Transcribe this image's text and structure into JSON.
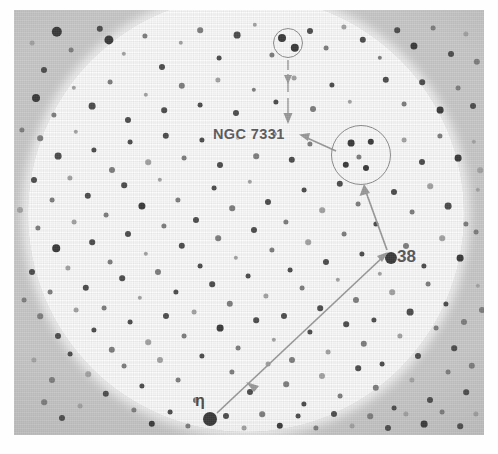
{
  "figure": {
    "kind": "astronomical-finder-chart",
    "plate_background_color": "#c9c9c9",
    "field_color": "#fcfcfc",
    "ink_color": "#4c4c4c",
    "annotation_color": "#9a9a9a"
  },
  "labels": {
    "ngc": "NGC 7331",
    "star_38": "38",
    "star_eta": "η"
  },
  "markers": {
    "small_circle": {
      "cx": 274,
      "cy": 33,
      "r": 15,
      "contains_stars": 2
    },
    "large_circle": {
      "cx": 347,
      "cy": 145,
      "r": 30,
      "contains_stars": 5
    },
    "star_38_point": {
      "x": 377,
      "y": 248
    },
    "star_eta_point": {
      "x": 196,
      "y": 409
    }
  },
  "arrows": [
    {
      "name": "small-circle-to-ngc",
      "from": [
        274,
        50
      ],
      "to": [
        274,
        112
      ],
      "heads": "end",
      "style": "dashed-vertical"
    },
    {
      "name": "large-circle-to-ngc-label",
      "from": [
        320,
        140
      ],
      "to": [
        286,
        126
      ],
      "heads": "end",
      "style": "solid"
    },
    {
      "name": "star38-to-large-circle",
      "from": [
        374,
        240
      ],
      "to": [
        350,
        177
      ],
      "heads": "end",
      "style": "solid"
    },
    {
      "name": "eta-to-star38",
      "from": [
        202,
        404
      ],
      "to": [
        371,
        245
      ],
      "heads": "both-plus-midpoint",
      "style": "solid"
    }
  ],
  "stars": [
    [
      43,
      22,
      5.2,
      "dark"
    ],
    [
      57,
      40,
      2.4,
      "soft"
    ],
    [
      86,
      19,
      3.2,
      ""
    ],
    [
      95,
      30,
      4.6,
      "dark"
    ],
    [
      110,
      44,
      2.2,
      "faint"
    ],
    [
      131,
      26,
      2.6,
      "soft"
    ],
    [
      148,
      57,
      3.0,
      ""
    ],
    [
      167,
      33,
      2.2,
      "faint"
    ],
    [
      186,
      20,
      2.8,
      "soft"
    ],
    [
      205,
      48,
      2.4,
      ""
    ],
    [
      223,
      25,
      3.4,
      ""
    ],
    [
      241,
      15,
      2.2,
      "faint"
    ],
    [
      258,
      45,
      2.6,
      "soft"
    ],
    [
      296,
      21,
      3.0,
      ""
    ],
    [
      312,
      38,
      2.4,
      "soft"
    ],
    [
      330,
      17,
      2.6,
      "faint"
    ],
    [
      349,
      30,
      3.2,
      ""
    ],
    [
      366,
      48,
      2.2,
      "soft"
    ],
    [
      383,
      20,
      2.8,
      ""
    ],
    [
      400,
      36,
      3.6,
      "dark"
    ],
    [
      419,
      18,
      2.4,
      "soft"
    ],
    [
      437,
      44,
      3.0,
      ""
    ],
    [
      452,
      24,
      2.6,
      "faint"
    ],
    [
      463,
      52,
      3.2,
      "soft"
    ],
    [
      30,
      60,
      3.0,
      ""
    ],
    [
      18,
      33,
      2.4,
      "faint"
    ],
    [
      22,
      88,
      4.0,
      "dark"
    ],
    [
      40,
      105,
      2.6,
      "soft"
    ],
    [
      60,
      78,
      2.2,
      "faint"
    ],
    [
      78,
      96,
      3.4,
      ""
    ],
    [
      96,
      72,
      2.4,
      "soft"
    ],
    [
      114,
      110,
      3.0,
      ""
    ],
    [
      132,
      85,
      2.2,
      "faint"
    ],
    [
      150,
      100,
      2.8,
      ""
    ],
    [
      168,
      76,
      3.2,
      "soft"
    ],
    [
      186,
      95,
      2.4,
      ""
    ],
    [
      204,
      70,
      2.6,
      "faint"
    ],
    [
      222,
      103,
      3.0,
      ""
    ],
    [
      240,
      80,
      2.2,
      "soft"
    ],
    [
      262,
      92,
      2.6,
      ""
    ],
    [
      280,
      68,
      2.4,
      "faint"
    ],
    [
      299,
      99,
      3.0,
      "soft"
    ],
    [
      318,
      75,
      2.6,
      ""
    ],
    [
      336,
      92,
      2.2,
      "faint"
    ],
    [
      372,
      70,
      3.2,
      ""
    ],
    [
      390,
      94,
      2.4,
      "soft"
    ],
    [
      408,
      72,
      2.8,
      ""
    ],
    [
      426,
      100,
      3.4,
      "dark"
    ],
    [
      444,
      78,
      2.4,
      "soft"
    ],
    [
      459,
      96,
      3.0,
      ""
    ],
    [
      26,
      128,
      2.8,
      "soft"
    ],
    [
      44,
      146,
      3.4,
      ""
    ],
    [
      62,
      122,
      2.2,
      "faint"
    ],
    [
      80,
      140,
      2.6,
      ""
    ],
    [
      98,
      160,
      3.0,
      "soft"
    ],
    [
      116,
      132,
      2.4,
      ""
    ],
    [
      134,
      152,
      2.8,
      "faint"
    ],
    [
      152,
      126,
      3.2,
      ""
    ],
    [
      170,
      148,
      2.4,
      "soft"
    ],
    [
      188,
      130,
      2.6,
      ""
    ],
    [
      206,
      155,
      3.0,
      ""
    ],
    [
      224,
      128,
      2.2,
      "faint"
    ],
    [
      242,
      146,
      2.8,
      "soft"
    ],
    [
      260,
      124,
      2.4,
      ""
    ],
    [
      278,
      150,
      3.2,
      ""
    ],
    [
      296,
      134,
      2.6,
      "soft"
    ],
    [
      390,
      130,
      2.4,
      "faint"
    ],
    [
      408,
      152,
      3.0,
      ""
    ],
    [
      426,
      126,
      2.6,
      "soft"
    ],
    [
      444,
      148,
      3.4,
      "dark"
    ],
    [
      460,
      132,
      2.2,
      "faint"
    ],
    [
      20,
      170,
      3.0,
      ""
    ],
    [
      38,
      190,
      2.4,
      "soft"
    ],
    [
      56,
      168,
      2.6,
      "faint"
    ],
    [
      74,
      186,
      3.2,
      ""
    ],
    [
      92,
      205,
      2.4,
      "soft"
    ],
    [
      110,
      175,
      2.8,
      ""
    ],
    [
      128,
      196,
      3.6,
      "dark"
    ],
    [
      146,
      170,
      2.2,
      "faint"
    ],
    [
      164,
      190,
      2.6,
      "soft"
    ],
    [
      182,
      210,
      3.0,
      ""
    ],
    [
      200,
      178,
      2.4,
      ""
    ],
    [
      218,
      198,
      2.8,
      "soft"
    ],
    [
      236,
      172,
      2.2,
      "faint"
    ],
    [
      254,
      192,
      3.0,
      ""
    ],
    [
      272,
      212,
      2.6,
      "soft"
    ],
    [
      290,
      180,
      2.4,
      ""
    ],
    [
      308,
      200,
      2.8,
      "faint"
    ],
    [
      326,
      174,
      3.2,
      ""
    ],
    [
      344,
      194,
      2.4,
      "soft"
    ],
    [
      362,
      214,
      2.6,
      ""
    ],
    [
      380,
      182,
      3.0,
      ""
    ],
    [
      398,
      202,
      2.4,
      "soft"
    ],
    [
      416,
      176,
      2.8,
      "faint"
    ],
    [
      434,
      196,
      3.4,
      ""
    ],
    [
      452,
      214,
      2.6,
      "soft"
    ],
    [
      464,
      180,
      2.2,
      "faint"
    ],
    [
      24,
      218,
      2.6,
      "soft"
    ],
    [
      42,
      238,
      3.8,
      "dark"
    ],
    [
      60,
      212,
      2.4,
      "faint"
    ],
    [
      78,
      232,
      2.8,
      ""
    ],
    [
      96,
      252,
      2.4,
      "soft"
    ],
    [
      114,
      224,
      3.0,
      ""
    ],
    [
      132,
      244,
      2.2,
      "faint"
    ],
    [
      150,
      216,
      2.6,
      "soft"
    ],
    [
      168,
      236,
      3.2,
      ""
    ],
    [
      186,
      256,
      2.4,
      ""
    ],
    [
      204,
      228,
      2.8,
      "soft"
    ],
    [
      222,
      248,
      2.2,
      "faint"
    ],
    [
      240,
      220,
      3.0,
      ""
    ],
    [
      258,
      240,
      2.6,
      "soft"
    ],
    [
      276,
      260,
      2.4,
      ""
    ],
    [
      294,
      232,
      2.8,
      "faint"
    ],
    [
      312,
      252,
      3.0,
      ""
    ],
    [
      330,
      224,
      2.4,
      "soft"
    ],
    [
      348,
      244,
      2.6,
      ""
    ],
    [
      366,
      264,
      2.2,
      "faint"
    ],
    [
      392,
      236,
      3.0,
      "soft"
    ],
    [
      410,
      256,
      2.6,
      ""
    ],
    [
      428,
      228,
      2.8,
      "faint"
    ],
    [
      446,
      248,
      3.4,
      "dark"
    ],
    [
      462,
      222,
      2.4,
      "soft"
    ],
    [
      18,
      262,
      3.0,
      ""
    ],
    [
      36,
      282,
      2.4,
      "soft"
    ],
    [
      54,
      258,
      2.6,
      "faint"
    ],
    [
      72,
      278,
      3.2,
      ""
    ],
    [
      90,
      298,
      2.4,
      "soft"
    ],
    [
      108,
      268,
      2.8,
      ""
    ],
    [
      126,
      288,
      2.2,
      "faint"
    ],
    [
      144,
      262,
      3.0,
      "soft"
    ],
    [
      162,
      282,
      2.6,
      ""
    ],
    [
      180,
      302,
      2.4,
      "faint"
    ],
    [
      198,
      274,
      2.8,
      ""
    ],
    [
      216,
      294,
      3.2,
      "soft"
    ],
    [
      234,
      266,
      2.4,
      ""
    ],
    [
      252,
      286,
      2.6,
      "faint"
    ],
    [
      270,
      306,
      3.0,
      ""
    ],
    [
      288,
      278,
      2.4,
      "soft"
    ],
    [
      306,
      298,
      2.8,
      ""
    ],
    [
      324,
      270,
      2.2,
      "faint"
    ],
    [
      342,
      290,
      3.0,
      "soft"
    ],
    [
      360,
      310,
      2.6,
      ""
    ],
    [
      378,
      282,
      2.8,
      "faint"
    ],
    [
      396,
      302,
      3.4,
      ""
    ],
    [
      414,
      274,
      2.4,
      "soft"
    ],
    [
      432,
      294,
      2.6,
      ""
    ],
    [
      450,
      312,
      3.0,
      "soft"
    ],
    [
      464,
      276,
      2.2,
      "faint"
    ],
    [
      26,
      306,
      2.8,
      "soft"
    ],
    [
      44,
      326,
      3.0,
      ""
    ],
    [
      62,
      300,
      2.4,
      "faint"
    ],
    [
      80,
      320,
      2.6,
      ""
    ],
    [
      98,
      340,
      3.2,
      "soft"
    ],
    [
      116,
      312,
      2.4,
      ""
    ],
    [
      134,
      332,
      2.8,
      "faint"
    ],
    [
      152,
      306,
      3.0,
      ""
    ],
    [
      170,
      326,
      2.4,
      "soft"
    ],
    [
      188,
      346,
      2.6,
      ""
    ],
    [
      206,
      318,
      3.4,
      "dark"
    ],
    [
      224,
      338,
      2.4,
      "soft"
    ],
    [
      242,
      310,
      2.8,
      ""
    ],
    [
      260,
      330,
      2.2,
      "faint"
    ],
    [
      278,
      350,
      3.0,
      "soft"
    ],
    [
      296,
      322,
      2.6,
      ""
    ],
    [
      314,
      342,
      2.4,
      "faint"
    ],
    [
      332,
      314,
      2.8,
      ""
    ],
    [
      350,
      334,
      3.2,
      "soft"
    ],
    [
      368,
      354,
      2.4,
      ""
    ],
    [
      386,
      326,
      2.6,
      "faint"
    ],
    [
      404,
      346,
      3.0,
      ""
    ],
    [
      422,
      318,
      2.4,
      "soft"
    ],
    [
      440,
      338,
      2.8,
      ""
    ],
    [
      458,
      356,
      3.2,
      "soft"
    ],
    [
      20,
      350,
      2.6,
      "faint"
    ],
    [
      38,
      370,
      3.0,
      "soft"
    ],
    [
      56,
      344,
      2.4,
      ""
    ],
    [
      74,
      364,
      2.8,
      "faint"
    ],
    [
      92,
      384,
      3.2,
      ""
    ],
    [
      110,
      356,
      2.4,
      "soft"
    ],
    [
      128,
      376,
      2.6,
      ""
    ],
    [
      146,
      350,
      3.0,
      "faint"
    ],
    [
      164,
      370,
      2.4,
      "soft"
    ],
    [
      182,
      390,
      2.8,
      ""
    ],
    [
      218,
      362,
      2.6,
      "soft"
    ],
    [
      236,
      382,
      3.0,
      ""
    ],
    [
      254,
      354,
      2.4,
      "faint"
    ],
    [
      272,
      374,
      2.8,
      "soft"
    ],
    [
      290,
      394,
      2.6,
      ""
    ],
    [
      308,
      366,
      3.0,
      "faint"
    ],
    [
      326,
      386,
      2.4,
      "soft"
    ],
    [
      344,
      358,
      2.8,
      ""
    ],
    [
      362,
      378,
      3.2,
      "soft"
    ],
    [
      380,
      398,
      2.4,
      ""
    ],
    [
      398,
      370,
      2.6,
      "faint"
    ],
    [
      416,
      390,
      3.0,
      ""
    ],
    [
      434,
      362,
      2.4,
      "soft"
    ],
    [
      452,
      382,
      2.8,
      ""
    ],
    [
      30,
      392,
      2.8,
      "soft"
    ],
    [
      48,
      408,
      3.0,
      ""
    ],
    [
      66,
      396,
      2.4,
      "faint"
    ],
    [
      120,
      400,
      2.6,
      "soft"
    ],
    [
      138,
      414,
      3.2,
      "dark"
    ],
    [
      156,
      402,
      2.4,
      ""
    ],
    [
      174,
      416,
      2.6,
      "soft"
    ],
    [
      212,
      406,
      3.0,
      ""
    ],
    [
      230,
      418,
      2.4,
      "faint"
    ],
    [
      248,
      404,
      2.8,
      "soft"
    ],
    [
      266,
      416,
      3.2,
      "dark"
    ],
    [
      284,
      406,
      2.4,
      ""
    ],
    [
      302,
      418,
      2.6,
      "soft"
    ],
    [
      320,
      404,
      3.0,
      ""
    ],
    [
      338,
      416,
      2.4,
      "faint"
    ],
    [
      356,
      406,
      2.8,
      "soft"
    ],
    [
      374,
      418,
      3.0,
      ""
    ],
    [
      392,
      404,
      2.6,
      "faint"
    ],
    [
      410,
      414,
      3.4,
      "dark"
    ],
    [
      428,
      402,
      2.4,
      "soft"
    ],
    [
      446,
      416,
      2.8,
      ""
    ],
    [
      462,
      404,
      2.6,
      "faint"
    ],
    [
      268,
      28,
      4.0,
      "dark"
    ],
    [
      281,
      38,
      4.2,
      "dark"
    ],
    [
      337,
      133,
      3.4,
      "dark"
    ],
    [
      357,
      132,
      3.2,
      "dark"
    ],
    [
      332,
      155,
      3.2,
      "dark"
    ],
    [
      352,
      158,
      3.0,
      "dark"
    ],
    [
      345,
      147,
      2.6,
      "soft"
    ],
    [
      377,
      248,
      6.0,
      "dark"
    ],
    [
      196,
      409,
      7.0,
      "dark"
    ],
    [
      8,
      120,
      2.6,
      "soft"
    ],
    [
      6,
      200,
      3.0,
      "faint"
    ],
    [
      10,
      290,
      2.4,
      "soft"
    ],
    [
      466,
      160,
      2.8,
      "faint"
    ],
    [
      468,
      300,
      3.0,
      "soft"
    ]
  ]
}
